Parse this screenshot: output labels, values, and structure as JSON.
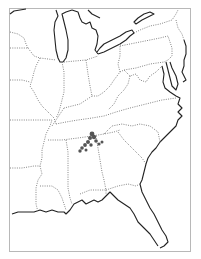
{
  "map": {
    "region": "Eastern United States",
    "frame_color": "#b8b8b8",
    "coastline_color": "#222222",
    "state_border_color": "#777777",
    "marker_color": "#555555",
    "markers": [
      {
        "x": 92,
        "y": 134,
        "r": 2.4
      },
      {
        "x": 94,
        "y": 137,
        "r": 2.2
      },
      {
        "x": 90,
        "y": 138,
        "r": 2.0
      },
      {
        "x": 96,
        "y": 141,
        "r": 1.8
      },
      {
        "x": 88,
        "y": 142,
        "r": 2.0
      },
      {
        "x": 85,
        "y": 145,
        "r": 1.9
      },
      {
        "x": 82,
        "y": 148,
        "r": 1.8
      },
      {
        "x": 80,
        "y": 151,
        "r": 1.7
      },
      {
        "x": 91,
        "y": 145,
        "r": 1.7
      },
      {
        "x": 99,
        "y": 144,
        "r": 1.6
      },
      {
        "x": 102,
        "y": 142,
        "r": 1.5
      },
      {
        "x": 86,
        "y": 150,
        "r": 1.5
      }
    ]
  }
}
